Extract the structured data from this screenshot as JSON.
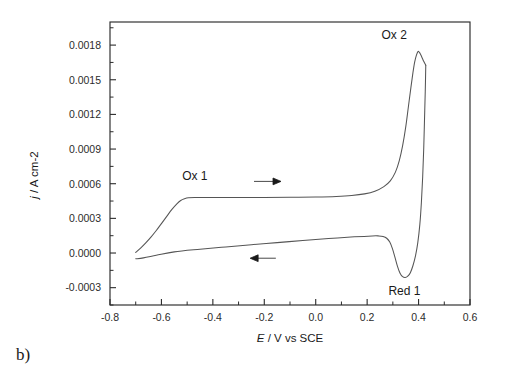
{
  "panel": {
    "label": "b)"
  },
  "chart_data": {
    "type": "line",
    "title": "",
    "subtitle": "",
    "xlabel_parts": {
      "italic": "E",
      "rest": " / V vs SCE"
    },
    "xlabel": "E / V vs SCE",
    "ylabel_parts": {
      "italic": "j",
      "rest": " / A cm-2"
    },
    "ylabel": "j / A cm-2",
    "xlim": [
      -0.8,
      0.6
    ],
    "ylim": [
      -0.00045,
      0.002
    ],
    "grid": false,
    "legend_position": "none",
    "xticks": [
      -0.8,
      -0.6,
      -0.4,
      -0.2,
      0.0,
      0.2,
      0.4,
      0.6
    ],
    "xtick_labels": [
      "-0.8",
      "-0.6",
      "-0.4",
      "-0.2",
      "0.0",
      "0.2",
      "0.4",
      "0.6"
    ],
    "x_minor_tick_step": 0.1,
    "yticks": [
      -0.0003,
      0.0,
      0.0003,
      0.0006,
      0.0009,
      0.0012,
      0.0015,
      0.0018
    ],
    "ytick_labels": [
      "-0.0003",
      "0.0000",
      "0.0003",
      "0.0006",
      "0.0009",
      "0.0012",
      "0.0015",
      "0.0018"
    ],
    "y_minor_tick_step": 0.00015,
    "series": [
      {
        "name": "forward-anodic-sweep",
        "direction": "positive-going",
        "points": [
          [
            -0.7,
            5e-06
          ],
          [
            -0.68,
            4.5e-05
          ],
          [
            -0.66,
            9e-05
          ],
          [
            -0.64,
            0.00014
          ],
          [
            -0.62,
            0.000195
          ],
          [
            -0.6,
            0.000255
          ],
          [
            -0.58,
            0.000315
          ],
          [
            -0.56,
            0.000375
          ],
          [
            -0.54,
            0.000425
          ],
          [
            -0.525,
            0.000455
          ],
          [
            -0.51,
            0.00047
          ],
          [
            -0.495,
            0.000478
          ],
          [
            -0.47,
            0.00048
          ],
          [
            -0.4,
            0.00048
          ],
          [
            -0.3,
            0.00048
          ],
          [
            -0.2,
            0.00048
          ],
          [
            -0.1,
            0.000482
          ],
          [
            0.0,
            0.000485
          ],
          [
            0.08,
            0.00049
          ],
          [
            0.14,
            0.000498
          ],
          [
            0.19,
            0.000512
          ],
          [
            0.23,
            0.000535
          ],
          [
            0.265,
            0.000575
          ],
          [
            0.29,
            0.000625
          ],
          [
            0.31,
            0.0007
          ],
          [
            0.325,
            0.0008
          ],
          [
            0.338,
            0.00093
          ],
          [
            0.35,
            0.00109
          ],
          [
            0.36,
            0.00126
          ],
          [
            0.37,
            0.00143
          ],
          [
            0.378,
            0.00156
          ],
          [
            0.385,
            0.001655
          ],
          [
            0.392,
            0.001715
          ],
          [
            0.398,
            0.001745
          ],
          [
            0.404,
            0.001735
          ],
          [
            0.412,
            0.0017
          ],
          [
            0.42,
            0.00166
          ],
          [
            0.428,
            0.001625
          ]
        ]
      },
      {
        "name": "reverse-cathodic-sweep",
        "direction": "negative-going",
        "points": [
          [
            0.428,
            0.001625
          ],
          [
            0.426,
            0.0014
          ],
          [
            0.423,
            0.00115
          ],
          [
            0.42,
            0.0009
          ],
          [
            0.416,
            0.00066
          ],
          [
            0.411,
            0.00044
          ],
          [
            0.405,
            0.00025
          ],
          [
            0.397,
            9e-05
          ],
          [
            0.388,
            -2.5e-05
          ],
          [
            0.378,
            -0.00011
          ],
          [
            0.368,
            -0.00017
          ],
          [
            0.358,
            -0.0002
          ],
          [
            0.348,
            -0.000212
          ],
          [
            0.338,
            -0.000205
          ],
          [
            0.328,
            -0.000175
          ],
          [
            0.318,
            -0.000115
          ],
          [
            0.308,
            -3.5e-05
          ],
          [
            0.298,
            4e-05
          ],
          [
            0.288,
            9.5e-05
          ],
          [
            0.276,
            0.000128
          ],
          [
            0.262,
            0.000143
          ],
          [
            0.245,
            0.000148
          ],
          [
            0.22,
            0.000148
          ],
          [
            0.15,
            0.00014
          ],
          [
            0.05,
            0.000125
          ],
          [
            -0.05,
            0.000108
          ],
          [
            -0.15,
            9e-05
          ],
          [
            -0.25,
            7.2e-05
          ],
          [
            -0.35,
            5.3e-05
          ],
          [
            -0.45,
            3.3e-05
          ],
          [
            -0.55,
            1e-05
          ],
          [
            -0.62,
            -2e-05
          ],
          [
            -0.67,
            -4.2e-05
          ],
          [
            -0.7,
            -5e-05
          ]
        ]
      }
    ],
    "annotations": [
      {
        "name": "ox1",
        "text": "Ox 1",
        "x": -0.47,
        "y": 0.00063
      },
      {
        "name": "ox2",
        "text": "Ox 2",
        "x": 0.305,
        "y": 0.00185
      },
      {
        "name": "red1",
        "text": "Red 1",
        "x": 0.345,
        "y": -0.00036
      }
    ],
    "arrows": [
      {
        "name": "forward-sweep-arrow",
        "direction": "right",
        "x_start": -0.24,
        "x_end": -0.135,
        "y": 0.00062
      },
      {
        "name": "reverse-sweep-arrow",
        "direction": "left",
        "x_start": -0.155,
        "x_end": -0.255,
        "y": -4.5e-05
      }
    ]
  }
}
